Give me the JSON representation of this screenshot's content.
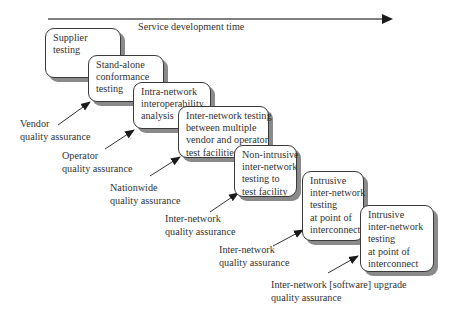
{
  "diagram": {
    "axis_label": "Service development time",
    "stages": [
      {
        "lines": [
          "Supplier",
          "testing"
        ]
      },
      {
        "lines": [
          "Stand-alone",
          "conformance",
          "testing"
        ]
      },
      {
        "lines": [
          "Intra-network",
          "interoperability",
          "analysis"
        ]
      },
      {
        "lines": [
          "Inter-network testing",
          "between multiple",
          "vendor and operator",
          "test facilities"
        ]
      },
      {
        "lines": [
          "Non-intrusive",
          "inter-network",
          "testing to",
          "test facility"
        ]
      },
      {
        "lines": [
          "Intrusive",
          "inter-network",
          "testing",
          "at point of",
          "interconnect"
        ]
      },
      {
        "lines": [
          "Intrusive",
          "inter-network",
          "testing",
          "at point of",
          "interconnect"
        ]
      }
    ],
    "assurance_labels": [
      {
        "lines": [
          "Vendor",
          "quality assurance"
        ]
      },
      {
        "lines": [
          "Operator",
          "quality assurance"
        ]
      },
      {
        "lines": [
          "Nationwide",
          "quality assurance"
        ]
      },
      {
        "lines": [
          "Inter-network",
          "quality assurance"
        ]
      },
      {
        "lines": [
          "Inter-network",
          "quality assurance"
        ]
      },
      {
        "lines": [
          "Inter-network [software] upgrade",
          "quality assurance"
        ]
      }
    ],
    "colors": {
      "line": "#3a3a3a",
      "shadow": "#8a8a8a",
      "text": "#333333",
      "background": "#ffffff"
    }
  }
}
